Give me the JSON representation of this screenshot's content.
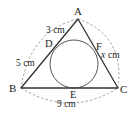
{
  "diagram": {
    "type": "triangle-with-incircle",
    "vertices": {
      "A": {
        "label": "A",
        "x": 78,
        "y": 19
      },
      "B": {
        "label": "B",
        "x": 21,
        "y": 88
      },
      "C": {
        "label": "C",
        "x": 118,
        "y": 88
      }
    },
    "tangent_points": {
      "D": {
        "label": "D",
        "x": 53,
        "y": 49
      },
      "E": {
        "label": "E",
        "x": 74,
        "y": 88
      },
      "F": {
        "label": "F",
        "x": 97,
        "y": 54
      }
    },
    "incircle": {
      "cx": 74,
      "cy": 64,
      "r": 24
    },
    "measures": {
      "AD": "3 cm",
      "BD": "5 cm",
      "BC": "9 cm",
      "CF": "cm",
      "CF_var": "x"
    },
    "colors": {
      "line": "#333333",
      "dashed": "#888888"
    }
  }
}
